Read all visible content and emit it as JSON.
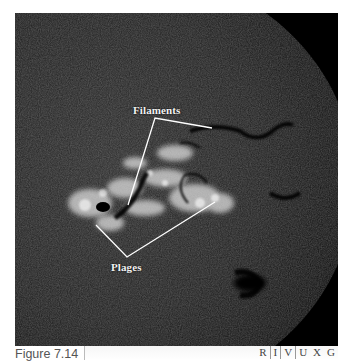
{
  "figure": {
    "number_label": "Figure 7.14"
  },
  "annotations": {
    "filaments_label": "Filaments",
    "plages_label": "Plages"
  },
  "wavelength_bands": {
    "bands": [
      "R",
      "I",
      "V",
      "U",
      "X",
      "G"
    ],
    "highlighted": null
  },
  "colors": {
    "background": "#ffffff",
    "photo_background": "#000000",
    "annotation_line": "#ffffff",
    "caption_text": "#555555"
  }
}
